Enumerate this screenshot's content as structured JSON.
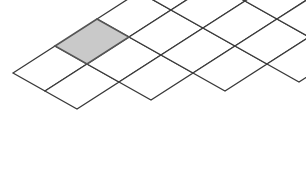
{
  "figure": {
    "type": "oblique-projection-grid",
    "background_color": "#ffffff",
    "cell_fill_color": "#ffffff",
    "cell_stroke_color": "#3a3a3a",
    "cell_stroke_width": 1.3,
    "highlight_fill_color": "#c9c9c9",
    "highlight_stroke_color": "#555555",
    "highlight_stroke_width": 1.6,
    "lattice": {
      "origin_x": 13,
      "origin_y": 73,
      "u_x": 42,
      "u_y": -27,
      "v_x": 32,
      "v_y": 18
    },
    "cells": [
      {
        "id": "c-0-0",
        "i": 0,
        "j": 0,
        "shaded": false
      },
      {
        "id": "c-1-0",
        "i": 1,
        "j": 0,
        "shaded": true
      },
      {
        "id": "c-2-0",
        "i": 2,
        "j": 0,
        "shaded": false
      },
      {
        "id": "c-3-0",
        "i": 3,
        "j": 0,
        "shaded": false
      },
      {
        "id": "c-0-1",
        "i": 0,
        "j": 1,
        "shaded": false
      },
      {
        "id": "c-1-1",
        "i": 1,
        "j": 1,
        "shaded": false
      },
      {
        "id": "c-2-1",
        "i": 2,
        "j": 1,
        "shaded": false
      },
      {
        "id": "c-3-1",
        "i": 3,
        "j": 1,
        "shaded": false
      },
      {
        "id": "c-4-1",
        "i": 4,
        "j": 1,
        "shaded": false
      },
      {
        "id": "c-1-2",
        "i": 1,
        "j": 2,
        "shaded": false
      },
      {
        "id": "c-2-2",
        "i": 2,
        "j": 2,
        "shaded": false
      },
      {
        "id": "c-3-2",
        "i": 3,
        "j": 2,
        "shaded": false
      },
      {
        "id": "c-4-2",
        "i": 4,
        "j": 2,
        "shaded": false
      },
      {
        "id": "c-2-3",
        "i": 2,
        "j": 3,
        "shaded": false
      },
      {
        "id": "c-3-3",
        "i": 3,
        "j": 3,
        "shaded": false
      },
      {
        "id": "c-4-3",
        "i": 4,
        "j": 3,
        "shaded": false
      },
      {
        "id": "c-3-4",
        "i": 3,
        "j": 4,
        "shaded": false
      },
      {
        "id": "c-4-4",
        "i": 4,
        "j": 4,
        "shaded": false
      }
    ],
    "shaded_cell_id": "c-1-0",
    "shaded_cell_count": 1,
    "total_cell_count": 18
  }
}
